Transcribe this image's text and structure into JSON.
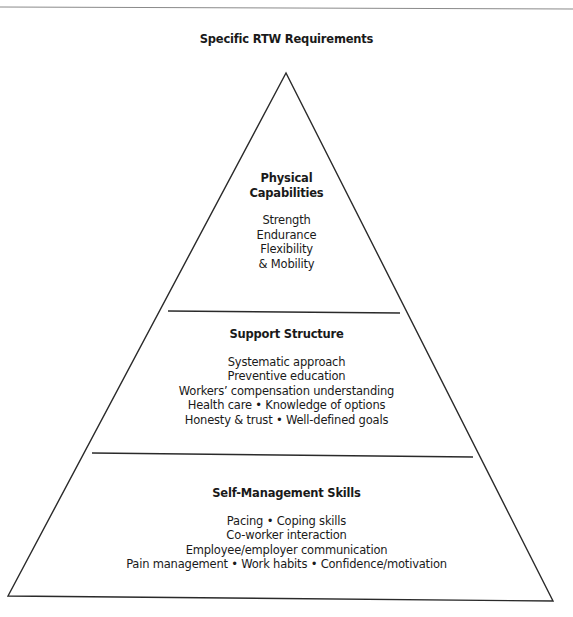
{
  "diagram": {
    "title": "Specific RTW Requirements",
    "type": "pyramid",
    "levels": [
      {
        "position": "top",
        "title_lines": [
          "Physical",
          "Capabilities"
        ],
        "items": [
          "Strength",
          "Endurance",
          "Flexibility",
          "& Mobility"
        ]
      },
      {
        "position": "middle",
        "title_lines": [
          "Support Structure"
        ],
        "items": [
          "Systematic approach",
          "Preventive education",
          "Workers’ compensation understanding",
          "Health care • Knowledge of options",
          "Honesty & trust • Well-defined goals"
        ]
      },
      {
        "position": "bottom",
        "title_lines": [
          "Self-Management Skills"
        ],
        "items": [
          "Pacing • Coping skills",
          "Co-worker interaction",
          "Employee/employer communication",
          "Pain management • Work habits • Confidence/motivation"
        ]
      }
    ],
    "colors": {
      "line": "#2a2a2a",
      "text": "#1a1a1a",
      "background": "#ffffff"
    }
  }
}
